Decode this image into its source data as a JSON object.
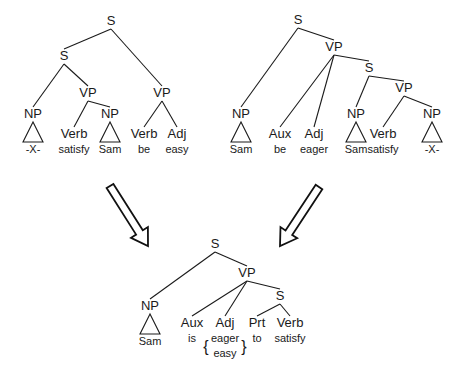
{
  "diagram": {
    "type": "syntax-tree-transformation",
    "trees": [
      {
        "id": "tree-easy",
        "nodes": [
          {
            "id": "a_S0",
            "label": "S",
            "x": 111,
            "y": 25,
            "kind": "cat"
          },
          {
            "id": "a_S1",
            "label": "S",
            "x": 64,
            "y": 60,
            "kind": "cat"
          },
          {
            "id": "a_VPr",
            "label": "VP",
            "x": 162,
            "y": 97,
            "kind": "cat"
          },
          {
            "id": "a_NP1",
            "label": "NP",
            "x": 33,
            "y": 118,
            "kind": "cat",
            "triangle": true,
            "leaf": "-X-"
          },
          {
            "id": "a_VP1",
            "label": "VP",
            "x": 88,
            "y": 97,
            "kind": "cat"
          },
          {
            "id": "a_Verb1",
            "label": "Verb",
            "x": 74,
            "y": 138,
            "kind": "cat",
            "leaf": "satisfy"
          },
          {
            "id": "a_NP2",
            "label": "NP",
            "x": 110,
            "y": 118,
            "kind": "cat",
            "triangle": true,
            "leaf": "Sam"
          },
          {
            "id": "a_Verb2",
            "label": "Verb",
            "x": 144,
            "y": 138,
            "kind": "cat",
            "leaf": "be"
          },
          {
            "id": "a_Adj",
            "label": "Adj",
            "x": 177,
            "y": 138,
            "kind": "cat",
            "leaf": "easy"
          }
        ],
        "edges": [
          [
            "a_S0",
            "a_S1"
          ],
          [
            "a_S0",
            "a_VPr"
          ],
          [
            "a_S1",
            "a_NP1"
          ],
          [
            "a_S1",
            "a_VP1"
          ],
          [
            "a_VP1",
            "a_Verb1"
          ],
          [
            "a_VP1",
            "a_NP2"
          ],
          [
            "a_VPr",
            "a_Verb2"
          ],
          [
            "a_VPr",
            "a_Adj"
          ]
        ]
      },
      {
        "id": "tree-eager",
        "nodes": [
          {
            "id": "b_S0",
            "label": "S",
            "x": 298,
            "y": 24,
            "kind": "cat"
          },
          {
            "id": "b_VP0",
            "label": "VP",
            "x": 334,
            "y": 51,
            "kind": "cat"
          },
          {
            "id": "b_S1",
            "label": "S",
            "x": 369,
            "y": 72,
            "kind": "cat"
          },
          {
            "id": "b_VP1",
            "label": "VP",
            "x": 404,
            "y": 92,
            "kind": "cat"
          },
          {
            "id": "b_NP0",
            "label": "NP",
            "x": 241,
            "y": 118,
            "kind": "cat",
            "triangle": true,
            "leaf": "Sam"
          },
          {
            "id": "b_Aux",
            "label": "Aux",
            "x": 280,
            "y": 138,
            "kind": "cat",
            "leaf": "be"
          },
          {
            "id": "b_Adj",
            "label": "Adj",
            "x": 314,
            "y": 138,
            "kind": "cat",
            "leaf": "eager"
          },
          {
            "id": "b_NP1",
            "label": "NP",
            "x": 356,
            "y": 118,
            "kind": "cat",
            "triangle": true,
            "leaf": "Sam"
          },
          {
            "id": "b_Verb",
            "label": "Verb",
            "x": 383,
            "y": 138,
            "kind": "cat",
            "leaf": "satisfy"
          },
          {
            "id": "b_NP2",
            "label": "NP",
            "x": 432,
            "y": 118,
            "kind": "cat",
            "triangle": true,
            "leaf": "-X-"
          }
        ],
        "edges": [
          [
            "b_S0",
            "b_NP0"
          ],
          [
            "b_S0",
            "b_VP0"
          ],
          [
            "b_VP0",
            "b_Aux"
          ],
          [
            "b_VP0",
            "b_Adj"
          ],
          [
            "b_VP0",
            "b_S1"
          ],
          [
            "b_S1",
            "b_NP1"
          ],
          [
            "b_S1",
            "b_VP1"
          ],
          [
            "b_VP1",
            "b_Verb"
          ],
          [
            "b_VP1",
            "b_NP2"
          ]
        ]
      },
      {
        "id": "tree-surface",
        "nodes": [
          {
            "id": "c_S0",
            "label": "S",
            "x": 215,
            "y": 248,
            "kind": "cat"
          },
          {
            "id": "c_VP",
            "label": "VP",
            "x": 247,
            "y": 277,
            "kind": "cat"
          },
          {
            "id": "c_S1",
            "label": "S",
            "x": 280,
            "y": 300,
            "kind": "cat"
          },
          {
            "id": "c_NP",
            "label": "NP",
            "x": 150,
            "y": 310,
            "kind": "cat",
            "triangle": true,
            "leaf": "Sam"
          },
          {
            "id": "c_Aux",
            "label": "Aux",
            "x": 192,
            "y": 327,
            "kind": "cat",
            "leaf": "is"
          },
          {
            "id": "c_Adj",
            "label": "Adj",
            "x": 225,
            "y": 327,
            "kind": "cat",
            "leaf": "eager",
            "alt_leaf": "easy",
            "braced": true
          },
          {
            "id": "c_Prt",
            "label": "Prt",
            "x": 257,
            "y": 327,
            "kind": "cat",
            "leaf": "to"
          },
          {
            "id": "c_Verb",
            "label": "Verb",
            "x": 290,
            "y": 327,
            "kind": "cat",
            "leaf": "satisfy"
          }
        ],
        "edges": [
          [
            "c_S0",
            "c_NP"
          ],
          [
            "c_S0",
            "c_VP"
          ],
          [
            "c_VP",
            "c_Aux"
          ],
          [
            "c_VP",
            "c_Adj"
          ],
          [
            "c_VP",
            "c_S1"
          ],
          [
            "c_S1",
            "c_Prt"
          ],
          [
            "c_S1",
            "c_Verb"
          ]
        ]
      }
    ],
    "arrows": [
      {
        "id": "arrow-left",
        "from": [
          110,
          186
        ],
        "to": [
          148,
          246
        ]
      },
      {
        "id": "arrow-right",
        "from": [
          319,
          187
        ],
        "to": [
          280,
          246
        ]
      }
    ],
    "colors": {
      "ink": "#1a1a1a",
      "background": "#ffffff"
    }
  }
}
